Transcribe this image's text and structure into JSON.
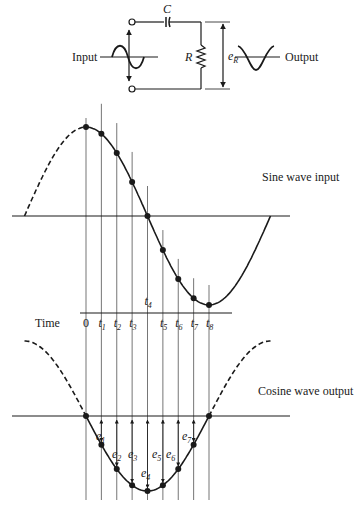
{
  "circuit": {
    "capacitor_label": "C",
    "resistor_label": "R",
    "output_voltage_label": "e",
    "output_voltage_sub": "R",
    "input_label": "Input",
    "output_label": "Output"
  },
  "sine_panel": {
    "label": "Sine wave input"
  },
  "time_axis": {
    "label": "Time",
    "ticks": [
      {
        "main": "0",
        "sub": ""
      },
      {
        "main": "t",
        "sub": "1"
      },
      {
        "main": "t",
        "sub": "2"
      },
      {
        "main": "t",
        "sub": "3"
      },
      {
        "main": "t",
        "sub": "4"
      },
      {
        "main": "t",
        "sub": "5"
      },
      {
        "main": "t",
        "sub": "6"
      },
      {
        "main": "t",
        "sub": "7"
      },
      {
        "main": "t",
        "sub": "8"
      }
    ]
  },
  "cosine_panel": {
    "label": "Cosine wave output",
    "e_labels": [
      {
        "main": "e",
        "sub": "1"
      },
      {
        "main": "e",
        "sub": "2"
      },
      {
        "main": "e",
        "sub": "3"
      },
      {
        "main": "e",
        "sub": "4"
      },
      {
        "main": "e",
        "sub": "5"
      },
      {
        "main": "e",
        "sub": "6"
      },
      {
        "main": "e",
        "sub": "7"
      }
    ]
  },
  "sample_phases_deg": [
    90,
    112.5,
    135,
    157.5,
    180,
    202.5,
    225,
    247.5,
    270
  ]
}
